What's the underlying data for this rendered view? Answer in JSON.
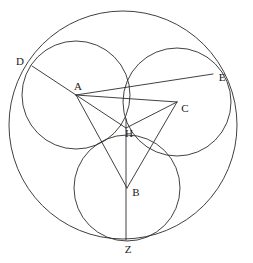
{
  "figure": {
    "width": 253,
    "height": 263,
    "background_color": "#ffffff",
    "stroke_color": "#2b2b2b",
    "stroke_width": 0.9
  },
  "chart_data": {
    "type": "diagram",
    "title": "",
    "points": [
      {
        "label": "A",
        "x": 76,
        "y": 95,
        "label_x": 78,
        "label_y": 86
      },
      {
        "label": "B",
        "x": 127,
        "y": 188,
        "label_x": 136,
        "label_y": 192
      },
      {
        "label": "C",
        "x": 177,
        "y": 102,
        "label_x": 185,
        "label_y": 108
      },
      {
        "label": "D",
        "x": 32,
        "y": 66,
        "label_x": 20,
        "label_y": 61
      },
      {
        "label": "E",
        "x": 213,
        "y": 74,
        "label_x": 222,
        "label_y": 77
      },
      {
        "label": "H",
        "x": 126,
        "y": 128,
        "label_x": 129,
        "label_y": 133
      },
      {
        "label": "Z",
        "x": 126,
        "y": 240,
        "label_x": 128,
        "label_y": 249
      }
    ],
    "circles": [
      {
        "name": "outer-circle",
        "cx": 123,
        "cy": 125,
        "r": 114
      },
      {
        "name": "circle-A",
        "cx": 76,
        "cy": 95,
        "r": 54
      },
      {
        "name": "circle-C",
        "cx": 177,
        "cy": 102,
        "r": 54
      },
      {
        "name": "circle-B",
        "cx": 127,
        "cy": 188,
        "r": 53
      }
    ],
    "segments": [
      {
        "name": "segment-D-A",
        "from": "D",
        "to": "A",
        "x1": 32,
        "y1": 66,
        "x2": 76,
        "y2": 95
      },
      {
        "name": "segment-A-C",
        "from": "A",
        "to": "C",
        "x1": 76,
        "y1": 95,
        "x2": 177,
        "y2": 102
      },
      {
        "name": "segment-A-E",
        "from": "A",
        "to": "E",
        "x1": 76,
        "y1": 95,
        "x2": 213,
        "y2": 74
      },
      {
        "name": "segment-A-H",
        "from": "A",
        "to": "H",
        "x1": 76,
        "y1": 95,
        "x2": 126,
        "y2": 128
      },
      {
        "name": "segment-A-B",
        "from": "A",
        "to": "B",
        "x1": 76,
        "y1": 95,
        "x2": 127,
        "y2": 188
      },
      {
        "name": "segment-C-H",
        "from": "C",
        "to": "H",
        "x1": 177,
        "y1": 102,
        "x2": 126,
        "y2": 128
      },
      {
        "name": "segment-C-B",
        "from": "C",
        "to": "B",
        "x1": 177,
        "y1": 102,
        "x2": 127,
        "y2": 188
      },
      {
        "name": "segment-H-Z",
        "from": "H",
        "to": "Z",
        "x1": 126,
        "y1": 119,
        "x2": 126,
        "y2": 240
      }
    ],
    "xlabel": "",
    "ylabel": "",
    "legend": [],
    "grid": false
  }
}
